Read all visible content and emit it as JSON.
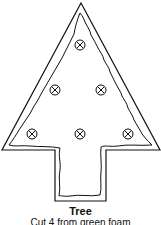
{
  "figure": {
    "title": "Tree",
    "instruction": "Cut 4 from green foam",
    "stroke_color": "#111111",
    "background_color": "#ffffff",
    "ornament_count": 6,
    "ornament_icon": "circle-x-icon"
  }
}
